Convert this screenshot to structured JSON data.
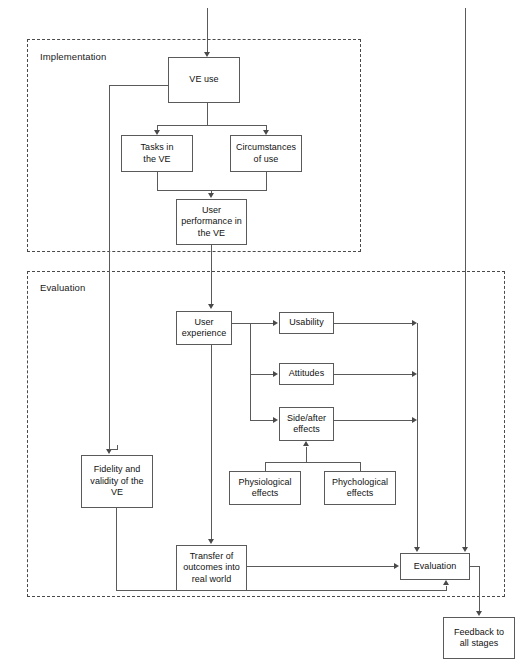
{
  "diagram": {
    "title": "",
    "groups": [
      {
        "id": "implementation",
        "label": "Implementation"
      },
      {
        "id": "evaluation",
        "label": "Evaluation"
      }
    ],
    "nodes": [
      {
        "id": "ve-use",
        "label": "VE use"
      },
      {
        "id": "tasks-in-the-ve",
        "line1": "Tasks in",
        "line2": "the VE"
      },
      {
        "id": "circumstances",
        "line1": "Circumstances",
        "line2": "of use"
      },
      {
        "id": "user-performance",
        "line1": "User",
        "line2": "performance in",
        "line3": "the VE"
      },
      {
        "id": "user-experience",
        "line1": "User",
        "line2": "experience"
      },
      {
        "id": "usability",
        "label": "Usability"
      },
      {
        "id": "attitudes",
        "label": "Attitudes"
      },
      {
        "id": "side-after-effects",
        "line1": "Side/after",
        "line2": "effects"
      },
      {
        "id": "physiological",
        "line1": "Physiological",
        "line2": "effects"
      },
      {
        "id": "phychological",
        "line1": "Phychological",
        "line2": "effects"
      },
      {
        "id": "fidelity",
        "line1": "Fidelity and",
        "line2": "validity of the",
        "line3": "VE"
      },
      {
        "id": "transfer",
        "line1": "Transfer of",
        "line2": "outcomes into",
        "line3": "real world"
      },
      {
        "id": "evaluation",
        "label": "Evaluation"
      },
      {
        "id": "feedback",
        "line1": "Feedback to",
        "line2": "all stages"
      }
    ],
    "colors": {
      "box_border": "#5a5a5a",
      "connector": "#5a5a5a",
      "group_border": "#4a4a4a",
      "text": "#111111",
      "background": "#ffffff"
    }
  }
}
